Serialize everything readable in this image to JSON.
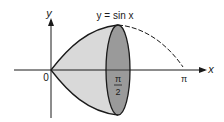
{
  "diagram": {
    "title_label": "y = sin x",
    "axes": {
      "x_label": "x",
      "y_label": "y",
      "origin_label": "0",
      "tick_labels": {
        "half_pi_num": "π",
        "half_pi_den": "2",
        "pi": "π"
      }
    },
    "colors": {
      "solid_fill": "#d9d9d9",
      "disk_fill": "#9a9a9a",
      "stroke": "#1a1a1a"
    }
  }
}
